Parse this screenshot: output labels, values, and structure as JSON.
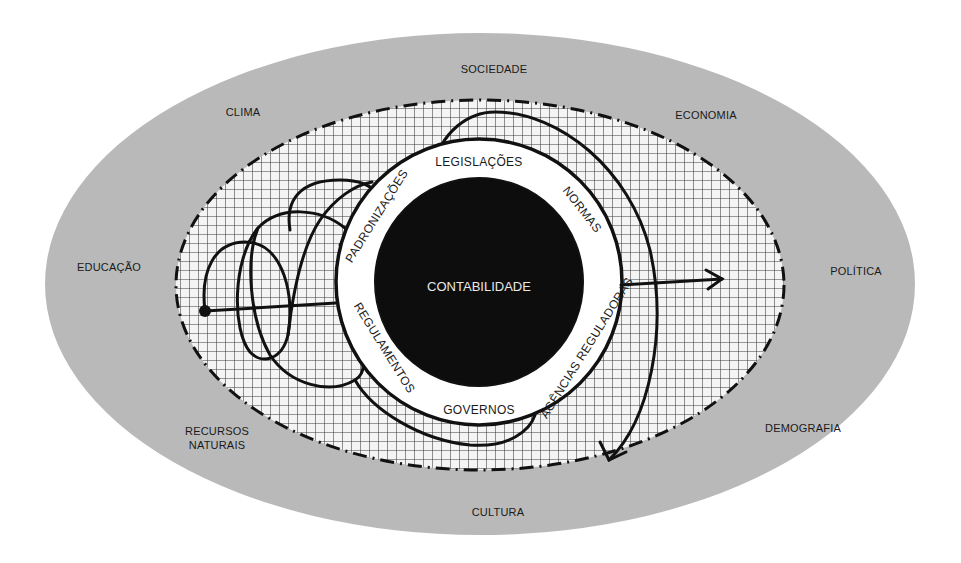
{
  "diagram": {
    "center": {
      "label": "CONTABILIDADE"
    },
    "ring_labels": [
      {
        "id": "legislacoes",
        "label": "LEGISLAÇÕES"
      },
      {
        "id": "normas",
        "label": "NORMAS"
      },
      {
        "id": "agencias",
        "label": "AGÊNCIAS REGULADORAS"
      },
      {
        "id": "governos",
        "label": "GOVERNOS"
      },
      {
        "id": "regulamentos",
        "label": "REGULAMENTOS"
      },
      {
        "id": "padronizacoes",
        "label": "PADRONIZAÇÕES"
      }
    ],
    "outer_labels": [
      {
        "id": "sociedade",
        "label": "SOCIEDADE"
      },
      {
        "id": "clima",
        "label": "CLIMA"
      },
      {
        "id": "economia",
        "label": "ECONOMIA"
      },
      {
        "id": "educacao",
        "label": "EDUCAÇÃO"
      },
      {
        "id": "politica",
        "label": "POLÍTICA"
      },
      {
        "id": "recursos",
        "label": "RECURSOS",
        "label2": "NATURAIS"
      },
      {
        "id": "demografia",
        "label": "DEMOGRAFIA"
      },
      {
        "id": "cultura",
        "label": "CULTURA"
      }
    ],
    "colors": {
      "outer_ellipse": "#b9b9b9",
      "grid_bg": "#f4f4f4",
      "grid_line": "#3a3a3a",
      "ring": "#ffffff",
      "core": "#0d0d0d",
      "stroke": "#111111"
    }
  }
}
